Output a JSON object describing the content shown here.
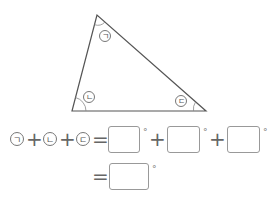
{
  "triangle": {
    "vertices": {
      "top": [
        97,
        15
      ],
      "bottom_left": [
        72,
        111
      ],
      "bottom_right": [
        206,
        111
      ]
    },
    "angle_labels": [
      {
        "name": "top",
        "label": "ㄱ"
      },
      {
        "name": "bottom-left",
        "label": "ㄴ"
      },
      {
        "name": "bottom-right",
        "label": "ㄷ"
      }
    ]
  },
  "equation": {
    "line1": {
      "terms": [
        "ㄱ",
        "ㄴ",
        "ㄷ"
      ],
      "plus": "+",
      "equals": "=",
      "degree": "°"
    },
    "line2": {
      "equals": "=",
      "degree": "°"
    }
  }
}
